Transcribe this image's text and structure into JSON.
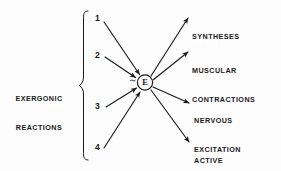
{
  "diagram": {
    "title_left": "EXERGONIC\nREACTIONS",
    "group_label_line1": "EXERGONIC",
    "group_label_line2": "REACTIONS",
    "brace_icon": "left-curly-brace-icon",
    "center_node": {
      "label": "E",
      "shape": "circle",
      "name": "energy-node"
    },
    "inputs": [
      {
        "id": "input-1",
        "label": "1"
      },
      {
        "id": "input-2",
        "label": "2"
      },
      {
        "id": "input-3",
        "label": "3"
      },
      {
        "id": "input-4",
        "label": "4"
      }
    ],
    "outputs": [
      {
        "id": "output-syntheses",
        "line1": "SYNTHESES",
        "line2": ""
      },
      {
        "id": "output-muscular-contractions",
        "line1": "MUSCULAR",
        "line2": "CONTRACTIONS"
      },
      {
        "id": "output-nervous-excitation",
        "line1": "NERVOUS",
        "line2": "EXCITATION"
      },
      {
        "id": "output-active-transport",
        "line1": "ACTIVE",
        "line2": "TRANSPORT"
      }
    ],
    "colors": {
      "ink": "#1a1a1a",
      "background": "#fdfdfd"
    }
  }
}
